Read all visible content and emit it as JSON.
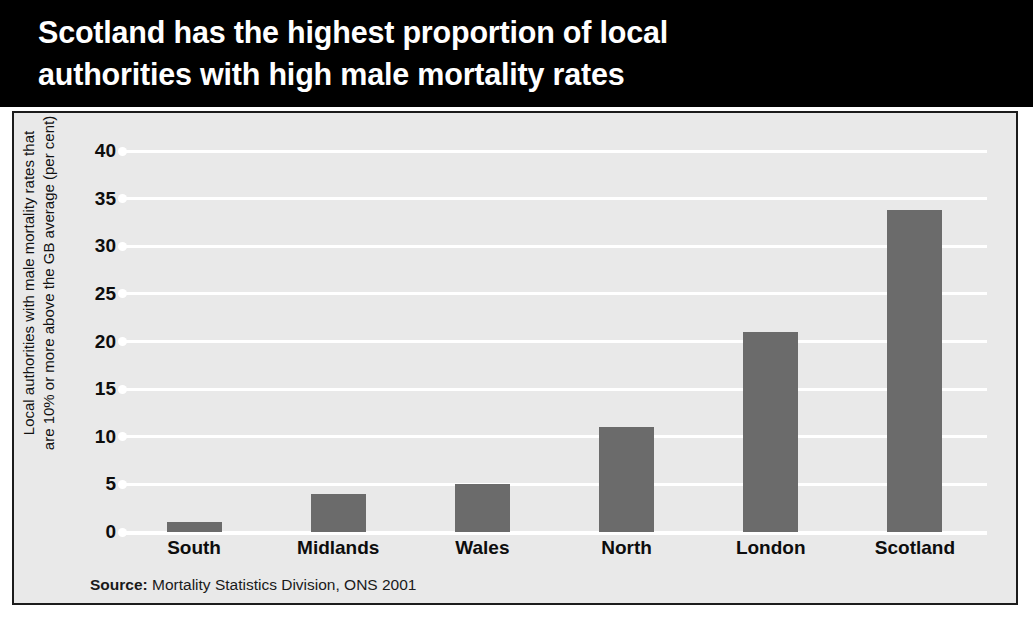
{
  "title": "Scotland has the highest proportion of local\nauthorities with high male mortality rates",
  "source": {
    "label": "Source:",
    "text": " Mortality Statistics Division, ONS 2001"
  },
  "colors": {
    "title_band": "#000000",
    "title_text": "#ffffff",
    "panel_background": "#e9e9e9",
    "panel_border": "#1c1c1c",
    "bar": "#6b6b6b",
    "gridline": "#ffffff",
    "tick_text": "#0d0d0d"
  },
  "chart_data": {
    "type": "bar",
    "title": "Scotland has the highest proportion of local authorities with high male mortality rates",
    "categories": [
      "South",
      "Midlands",
      "Wales",
      "North",
      "London",
      "Scotland"
    ],
    "values": [
      1,
      4,
      5,
      11,
      21,
      33.8
    ],
    "xlabel": "",
    "ylabel": "Local authorities with male mortality rates that\nare 10% or more above the GB average (per cent)",
    "ylim": [
      0,
      40
    ],
    "yticks": [
      0,
      5,
      10,
      15,
      20,
      25,
      30,
      35,
      40
    ],
    "ytick_labels": [
      "0",
      "5",
      "10",
      "15",
      "20",
      "25",
      "30",
      "35",
      "40"
    ],
    "grid": true,
    "legend": "none",
    "source": "Source: Mortality Statistics Division, ONS 2001"
  }
}
